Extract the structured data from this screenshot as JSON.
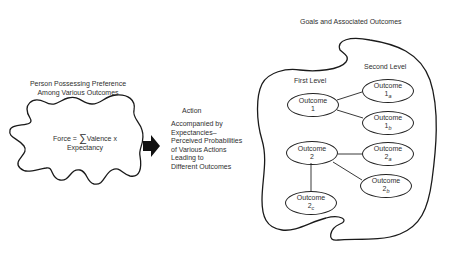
{
  "person": {
    "title_line1": "Person Possessing Preference",
    "title_line2": "Among Various Outcomes",
    "formula_prefix": "Force = ",
    "formula_sigma": "∑",
    "formula_suffix": "Valence x",
    "formula_line2": "Expectancy"
  },
  "arrow": {
    "icon": "right-arrow-icon"
  },
  "action": {
    "title": "Action",
    "lines": [
      "Accompanied by",
      "Expectancies–",
      "Perceived Probabilities",
      "of Various Actions",
      "Leading to",
      "Different Outcomes"
    ]
  },
  "goals": {
    "title": "Goals and Associated Outcomes",
    "first_level_label": "First Level",
    "second_level_label": "Second Level",
    "outcomes": {
      "o1": {
        "label": "Outcome",
        "num": "1",
        "sub": ""
      },
      "o1a": {
        "label": "Outcome",
        "num": "1",
        "sub": "a"
      },
      "o1b": {
        "label": "Outcome",
        "num": "1",
        "sub": "b"
      },
      "o2": {
        "label": "Outcome",
        "num": "2",
        "sub": ""
      },
      "o2a": {
        "label": "Outcome",
        "num": "2",
        "sub": "a"
      },
      "o2b": {
        "label": "Outcome",
        "num": "2",
        "sub": "b"
      },
      "o2c": {
        "label": "Outcome",
        "num": "2",
        "sub": "c"
      }
    }
  }
}
